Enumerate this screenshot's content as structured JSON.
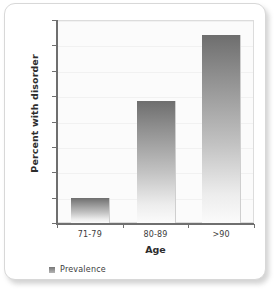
{
  "chart_data": {
    "type": "bar",
    "title": "",
    "subtitle": "",
    "categories": [
      "71-79",
      "80-89",
      ">90"
    ],
    "series": [
      {
        "name": "Prevalence",
        "values": [
          5,
          24,
          37
        ]
      }
    ],
    "values": [
      5,
      24,
      37
    ],
    "xlabel": "Age",
    "ylabel": "Percent with disorder",
    "ylim": [
      0,
      40
    ],
    "ytick_step": 5,
    "yticks": [
      "40",
      "35",
      "30",
      "25",
      "20",
      "15",
      "10",
      "5",
      "0"
    ],
    "grid": true,
    "legend_position": "bottom-left",
    "annotations": [],
    "colors": {
      "bar_top": "#6e6e6e",
      "bar_bottom": "#fbfbfb",
      "axis": "#6f6f6f",
      "gridline": "#f1f1f1",
      "plot_background": "#fbfbfb",
      "card_background": "#ffffff",
      "card_border": "#d8d8d8",
      "text": "#3c3c3c"
    }
  },
  "axes": {
    "y_title": "Percent with disorder",
    "x_title": "Age",
    "y_tick_labels": [
      "40",
      "35",
      "30",
      "25",
      "20",
      "15",
      "10",
      "5",
      "0"
    ],
    "x_tick_labels": [
      "71-79",
      "80-89",
      ">90"
    ]
  },
  "legend": {
    "entries": [
      {
        "label": "Prevalence",
        "swatch_icon": "square-swatch-icon"
      }
    ]
  }
}
